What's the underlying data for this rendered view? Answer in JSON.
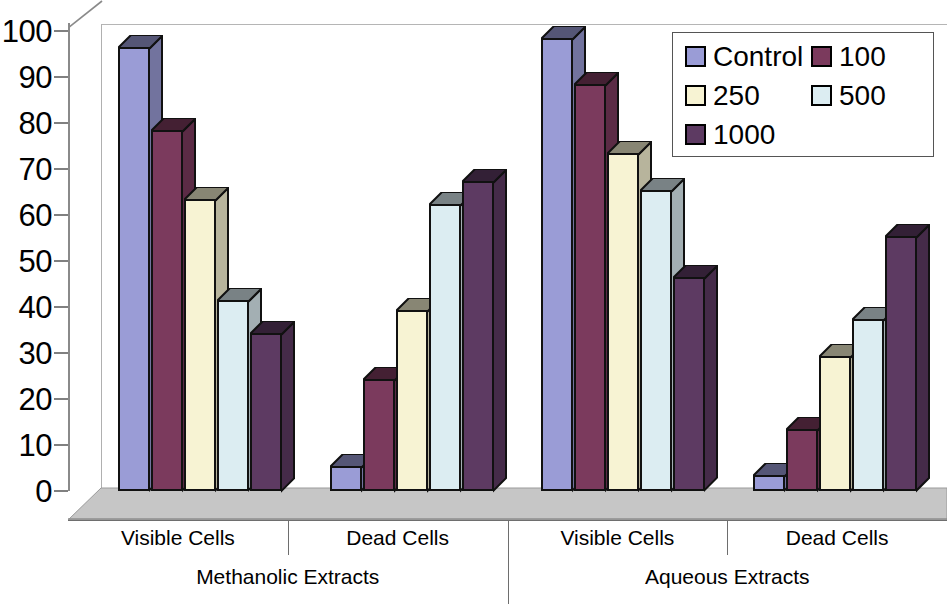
{
  "chart_data": {
    "type": "bar",
    "title": "",
    "xlabel": "",
    "ylabel": "",
    "ylim": [
      0,
      100
    ],
    "ytick_step": 10,
    "grid": false,
    "legend_position": "top-right",
    "style": "3d-clustered-column",
    "yticks": [
      "0",
      "10",
      "20",
      "30",
      "40",
      "50",
      "60",
      "70",
      "80",
      "90",
      "100"
    ],
    "categories": [
      "Visible Cells",
      "Dead Cells",
      "Visible Cells",
      "Dead Cells"
    ],
    "super_categories": [
      "Methanolic Extracts",
      "Aqueous Extracts"
    ],
    "legend_entries": [
      "Control",
      "100",
      "250",
      "500",
      "1000"
    ],
    "series": [
      {
        "name": "Control",
        "color": "#9a9cd6",
        "values": [
          96,
          5,
          98,
          3
        ]
      },
      {
        "name": "100",
        "color": "#7b3a5d",
        "values": [
          78,
          24,
          88,
          13
        ]
      },
      {
        "name": "250",
        "color": "#f7f3d3",
        "values": [
          63,
          39,
          73,
          29
        ]
      },
      {
        "name": "500",
        "color": "#dcedf2",
        "values": [
          41,
          62,
          65,
          37
        ]
      },
      {
        "name": "1000",
        "color": "#5d3a62",
        "values": [
          34,
          67,
          46,
          55
        ]
      }
    ],
    "groups": [
      {
        "super_category": "Methanolic Extracts",
        "category": "Visible Cells",
        "bars": [
          {
            "series": "Control",
            "value": 96
          },
          {
            "series": "100",
            "value": 78
          },
          {
            "series": "250",
            "value": 63
          },
          {
            "series": "500",
            "value": 41
          },
          {
            "series": "1000",
            "value": 34
          }
        ]
      },
      {
        "super_category": "Methanolic Extracts",
        "category": "Dead Cells",
        "bars": [
          {
            "series": "Control",
            "value": 5
          },
          {
            "series": "100",
            "value": 24
          },
          {
            "series": "250",
            "value": 39
          },
          {
            "series": "500",
            "value": 62
          },
          {
            "series": "1000",
            "value": 67
          }
        ]
      },
      {
        "super_category": "Aqueous Extracts",
        "category": "Visible Cells",
        "bars": [
          {
            "series": "Control",
            "value": 98
          },
          {
            "series": "100",
            "value": 88
          },
          {
            "series": "250",
            "value": 73
          },
          {
            "series": "500",
            "value": 65
          },
          {
            "series": "1000",
            "value": 46
          }
        ]
      },
      {
        "super_category": "Aqueous Extracts",
        "category": "Dead Cells",
        "bars": [
          {
            "series": "Control",
            "value": 3
          },
          {
            "series": "100",
            "value": 13
          },
          {
            "series": "250",
            "value": 29
          },
          {
            "series": "500",
            "value": 37
          },
          {
            "series": "1000",
            "value": 55
          }
        ]
      }
    ]
  },
  "legend": {
    "rows": [
      [
        {
          "label": "Control",
          "color": "#9a9cd6"
        },
        {
          "label": "100",
          "color": "#7b3a5d"
        }
      ],
      [
        {
          "label": "250",
          "color": "#f7f3d3"
        },
        {
          "label": "500",
          "color": "#dcedf2"
        }
      ],
      [
        {
          "label": "1000",
          "color": "#5d3a62"
        }
      ]
    ]
  },
  "colors": {
    "floor": "#b9b9b9",
    "floor_top": "#d2d2d2",
    "axis_line": "#8a8a8a",
    "tick": "#808080",
    "bar_outline": "#111111",
    "text": "#000000"
  }
}
